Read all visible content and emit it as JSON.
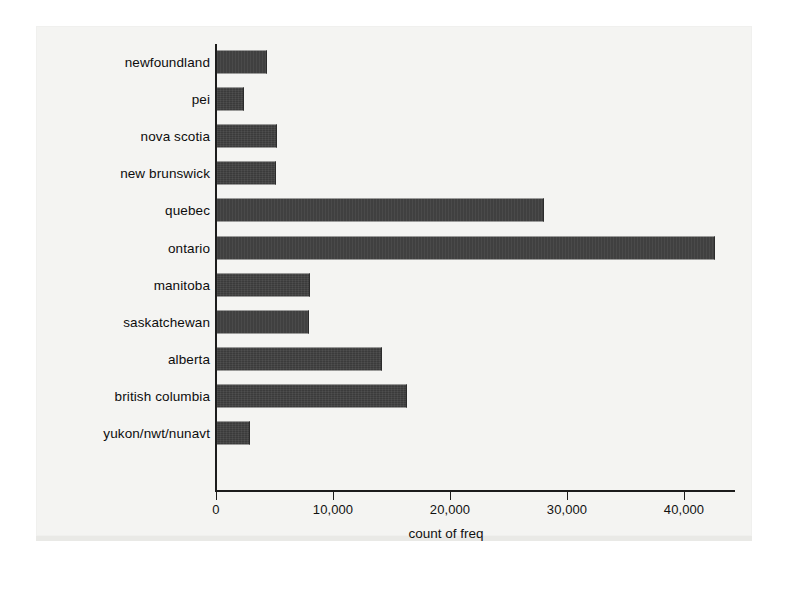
{
  "chart_data": {
    "type": "bar",
    "orientation": "horizontal",
    "title": "",
    "xlabel": "count of freq",
    "ylabel": "",
    "xlim": [
      0,
      44500
    ],
    "xticks": [
      0,
      10000,
      20000,
      30000,
      40000
    ],
    "xtick_labels": [
      "0",
      "10,000",
      "20,000",
      "30,000",
      "40,000"
    ],
    "grid": false,
    "legend": false,
    "bar_color": "#3b3b3b",
    "categories": [
      "newfoundland",
      "pei",
      "nova scotia",
      "new brunswick",
      "quebec",
      "ontario",
      "manitoba",
      "saskatchewan",
      "alberta",
      "british columbia",
      "yukon/nwt/nunavt"
    ],
    "values": [
      4200,
      2200,
      5000,
      4950,
      27900,
      42500,
      7850,
      7800,
      14000,
      16150,
      2700
    ],
    "series": [
      {
        "name": "count of freq",
        "values": [
          4200,
          2200,
          5000,
          4950,
          27900,
          42500,
          7850,
          7800,
          14000,
          16150,
          2700
        ]
      }
    ]
  },
  "axis": {
    "x_title": "count of freq"
  }
}
